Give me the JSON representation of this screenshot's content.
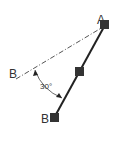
{
  "diagram": {
    "type": "geometry-rotation-sketch",
    "labels": {
      "point_a": "A",
      "point_b_reference": "B",
      "point_b_rotated": "B",
      "angle": "30°"
    },
    "colors": {
      "line": "#222222",
      "reference_line": "#444444",
      "handle": "#333333",
      "label": "#333333",
      "background": "#ffffff"
    }
  }
}
